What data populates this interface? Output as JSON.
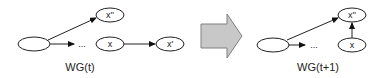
{
  "diagram": {
    "left_graph": {
      "label": "WG(t)",
      "nodes": {
        "source": "",
        "x_double_prime": "x''",
        "ellipsis": "...",
        "x": "x",
        "x_prime": "x'"
      },
      "edges": [
        {
          "from": "source",
          "to": "x_double_prime"
        },
        {
          "from": "source",
          "to": "ellipsis"
        },
        {
          "from": "x",
          "to": "x_prime"
        }
      ]
    },
    "transition_arrow": {
      "fill_color": "#c8c8c8",
      "stroke_color": "#808080"
    },
    "right_graph": {
      "label": "WG(t+1)",
      "nodes": {
        "source": "",
        "x_double_prime": "x''",
        "ellipsis": "...",
        "x": "x"
      },
      "edges": [
        {
          "from": "source",
          "to": "x_double_prime"
        },
        {
          "from": "source",
          "to": "ellipsis"
        },
        {
          "from": "x",
          "to": "x_double_prime"
        }
      ]
    }
  }
}
